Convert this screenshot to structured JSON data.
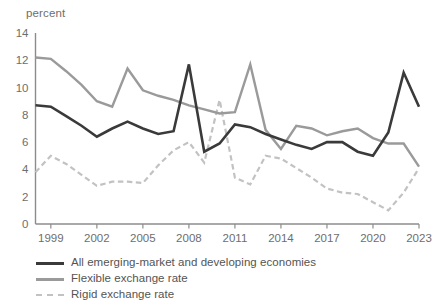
{
  "chart_data": {
    "type": "line",
    "title": "",
    "subtitle": "",
    "xlabel": "",
    "ylabel": "percent",
    "ylim": [
      0,
      14
    ],
    "xlim": [
      1998,
      2023
    ],
    "grid": false,
    "legend_position": "bottom-left",
    "y_ticks": [
      "0",
      "2",
      "4",
      "6",
      "8",
      "10",
      "12",
      "14"
    ],
    "y_tick_values": [
      0,
      2,
      4,
      6,
      8,
      10,
      12,
      14
    ],
    "x_ticks": [
      "1999",
      "2002",
      "2005",
      "2008",
      "2011",
      "2014",
      "2017",
      "2020",
      "2023"
    ],
    "x_tick_values": [
      1999,
      2002,
      2005,
      2008,
      2011,
      2014,
      2017,
      2020,
      2023
    ],
    "x": [
      1998,
      1999,
      2000,
      2001,
      2002,
      2003,
      2004,
      2005,
      2006,
      2007,
      2008,
      2009,
      2010,
      2011,
      2012,
      2013,
      2014,
      2015,
      2016,
      2017,
      2018,
      2019,
      2020,
      2021,
      2022,
      2023
    ],
    "series": [
      {
        "name": "All emerging-market and developing economies",
        "color": "#3a3a3a",
        "style": "solid",
        "width": 2.6,
        "values": [
          8.7,
          8.6,
          7.9,
          7.2,
          6.4,
          7.0,
          7.5,
          7.0,
          6.6,
          6.8,
          11.7,
          5.3,
          5.9,
          7.3,
          7.1,
          6.6,
          6.2,
          5.8,
          5.5,
          6.0,
          6.0,
          5.3,
          5.0,
          6.7,
          11.1,
          8.6
        ],
        "annotations": []
      },
      {
        "name": "Flexible exchange rate",
        "color": "#9a9a9a",
        "style": "solid",
        "width": 2.4,
        "values": [
          12.2,
          12.1,
          11.2,
          10.2,
          9.0,
          8.6,
          11.4,
          9.8,
          9.4,
          9.1,
          8.7,
          8.4,
          8.1,
          8.2,
          11.7,
          6.9,
          5.5,
          7.2,
          7.0,
          6.5,
          6.8,
          7.0,
          6.3,
          5.9,
          5.9,
          4.2
        ],
        "annotations": []
      },
      {
        "name": "Rigid exchange rate",
        "color": "#c2c2c2",
        "style": "dashed",
        "width": 2.2,
        "values": [
          3.8,
          5.0,
          4.4,
          3.6,
          2.8,
          3.1,
          3.1,
          3.0,
          4.3,
          5.4,
          6.0,
          4.5,
          9.1,
          3.4,
          2.9,
          5.0,
          4.8,
          4.1,
          3.4,
          2.6,
          2.3,
          2.2,
          1.6,
          1.0,
          2.3,
          4.1
        ],
        "annotations": []
      }
    ]
  },
  "legend": {
    "entries": [
      {
        "label": "All emerging-market and developing economies",
        "swatch": "solid-dark"
      },
      {
        "label": "Flexible exchange rate",
        "swatch": "solid-gray"
      },
      {
        "label": "Rigid exchange rate",
        "swatch": "dashed"
      }
    ]
  },
  "colors": {
    "axis": "#8c8c8c",
    "tick_text": "#6e6e6e",
    "series_all": "#3a3a3a",
    "series_flexible": "#9a9a9a",
    "series_rigid": "#c2c2c2",
    "background": "#ffffff"
  }
}
